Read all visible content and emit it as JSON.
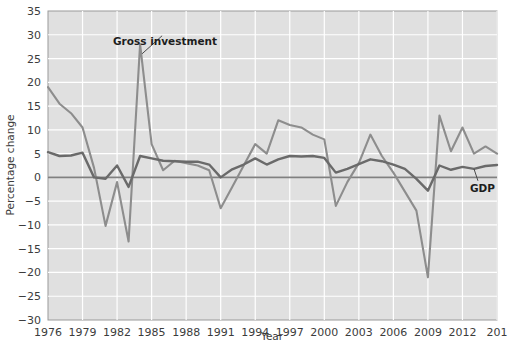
{
  "chart_data": {
    "type": "line",
    "title": "",
    "subtitle": "",
    "xlabel": "Year",
    "ylabel": "Percentage change",
    "xlim": [
      1976,
      2015
    ],
    "ylim": [
      -30,
      35
    ],
    "grid": true,
    "grid_color": "#ffffff",
    "plot_background": "#e0e0e0",
    "legend": "inline-annotations",
    "x_tick_labels": [
      "1976",
      "1979",
      "1982",
      "1985",
      "1988",
      "1991",
      "1994",
      "1997",
      "2000",
      "2003",
      "2006",
      "2009",
      "2012",
      "201"
    ],
    "x_ticks": [
      1976,
      1979,
      1982,
      1985,
      1988,
      1991,
      1994,
      1997,
      2000,
      2003,
      2006,
      2009,
      2012,
      2015
    ],
    "y_tick_labels": [
      "35",
      "30",
      "25",
      "20",
      "15",
      "10",
      "5",
      "0",
      "−5",
      "−10",
      "−15",
      "−20",
      "−25",
      "−30"
    ],
    "y_ticks": [
      35,
      30,
      25,
      20,
      15,
      10,
      5,
      0,
      -5,
      -10,
      -15,
      -20,
      -25,
      -30
    ],
    "zero_line": 0,
    "zero_line_color": "#808080",
    "x": [
      1976,
      1977,
      1978,
      1979,
      1980,
      1981,
      1982,
      1983,
      1984,
      1985,
      1986,
      1987,
      1988,
      1989,
      1990,
      1991,
      1992,
      1993,
      1994,
      1995,
      1996,
      1997,
      1998,
      1999,
      2000,
      2001,
      2002,
      2003,
      2004,
      2005,
      2006,
      2007,
      2008,
      2009,
      2010,
      2011,
      2012,
      2013,
      2014,
      2015
    ],
    "series": [
      {
        "name": "Gross investment",
        "color": "#8d8d8d",
        "line_width": 2.1,
        "label_position": "above-1984-peak",
        "values": [
          19.0,
          15.5,
          13.5,
          10.5,
          2.0,
          -10.2,
          -1.0,
          -13.5,
          28.0,
          7.0,
          1.5,
          3.5,
          3.0,
          2.5,
          1.5,
          -6.5,
          -2.0,
          2.5,
          7.0,
          5.0,
          12.0,
          11.0,
          10.5,
          9.0,
          8.0,
          -6.0,
          -1.0,
          3.0,
          9.0,
          4.5,
          1.0,
          -3.0,
          -7.0,
          -21.0,
          13.0,
          5.5,
          10.5,
          5.0,
          6.5,
          5.0
        ]
      },
      {
        "name": "GDP",
        "color": "#6a6a6a",
        "line_width": 2.4,
        "label_position": "right-2013",
        "values": [
          5.3,
          4.5,
          4.6,
          5.2,
          0.0,
          -0.3,
          2.5,
          -2.0,
          4.5,
          4.0,
          3.5,
          3.4,
          3.3,
          3.3,
          2.7,
          0.0,
          1.7,
          2.7,
          4.0,
          2.7,
          3.8,
          4.5,
          4.4,
          4.5,
          4.1,
          1.0,
          1.8,
          2.8,
          3.8,
          3.4,
          2.7,
          1.8,
          -0.3,
          -2.8,
          2.5,
          1.6,
          2.2,
          1.8,
          2.4,
          2.6
        ]
      }
    ],
    "annotations": [
      {
        "text": "Gross investment",
        "target_x": 1984,
        "target_y": 26.0
      },
      {
        "text": "GDP",
        "target_x": 2013,
        "target_y": 1.8
      }
    ]
  },
  "axes": {
    "ylabel": "Percentage change",
    "xlabel": "Year"
  }
}
